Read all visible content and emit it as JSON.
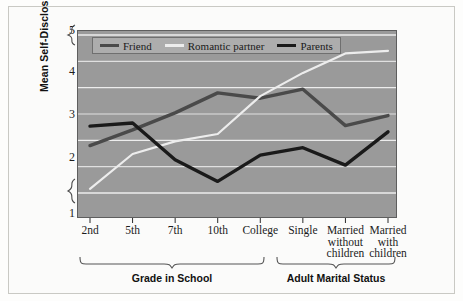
{
  "chart_data": {
    "type": "line",
    "title": "",
    "xlabel": "",
    "ylabel": "Mean Self-Disclosure Score",
    "ylim": [
      1,
      5
    ],
    "yticks": [
      1,
      2,
      3,
      4,
      5
    ],
    "gridlines": [
      2,
      2.5,
      3,
      3.5,
      4,
      4.5,
      5
    ],
    "grid": true,
    "axis_break": "between 1 and 2",
    "legend_position": "top-left inside plot",
    "categories": [
      "2nd",
      "5th",
      "7th",
      "10th",
      "College",
      "Single",
      "Married without children",
      "Married with children"
    ],
    "series": [
      {
        "name": "Friend",
        "color": "#4a4a4a",
        "values": [
          2.9,
          3.2,
          3.52,
          3.9,
          3.8,
          3.97,
          3.28,
          3.47
        ]
      },
      {
        "name": "Romantic partner",
        "color": "#ededed",
        "values": [
          2.08,
          2.74,
          2.98,
          3.12,
          3.84,
          4.28,
          4.65,
          4.7
        ]
      },
      {
        "name": "Parents",
        "color": "#1a1a1a",
        "values": [
          3.27,
          3.33,
          2.63,
          2.22,
          2.72,
          2.86,
          2.53,
          3.16
        ]
      }
    ]
  },
  "axis": {
    "y_label": "Mean Self-Disclosure Score",
    "y_tick_labels": [
      "5",
      "4",
      "3",
      "2",
      "1"
    ],
    "x_tick_labels": [
      {
        "lines": [
          "2nd"
        ]
      },
      {
        "lines": [
          "5th"
        ]
      },
      {
        "lines": [
          "7th"
        ]
      },
      {
        "lines": [
          "10th"
        ]
      },
      {
        "lines": [
          "College"
        ]
      },
      {
        "lines": [
          "Single"
        ]
      },
      {
        "lines": [
          "Married",
          "without",
          "children"
        ]
      },
      {
        "lines": [
          "Married",
          "with",
          "children"
        ]
      }
    ]
  },
  "legend": {
    "items": [
      {
        "label": "Friend",
        "color": "#4a4a4a"
      },
      {
        "label": "Romantic partner",
        "color": "#ededed"
      },
      {
        "label": "Parents",
        "color": "#1a1a1a"
      }
    ]
  },
  "groups": [
    {
      "label": "Grade in School"
    },
    {
      "label": "Adult Marital Status"
    }
  ],
  "colors": {
    "plot_background": "#9a9a9a",
    "gridline": "#f2f2f2",
    "figure_background": "#fbfbfa",
    "text": "#1a1a1a"
  }
}
